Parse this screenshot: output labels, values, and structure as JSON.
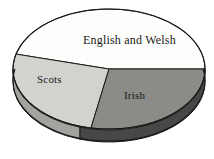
{
  "chart_data": {
    "type": "pie",
    "title": "",
    "subtitle": "",
    "xlabel": "",
    "ylabel": "",
    "legend": "none",
    "grid": false,
    "three_d": true,
    "categories": [
      "English and Welsh",
      "Scots",
      "Irish"
    ],
    "values": [
      46,
      26,
      28
    ],
    "unit": "percent",
    "labels_inside": true,
    "slices": [
      {
        "name": "English and Welsh",
        "value": 46,
        "label": "English and Welsh",
        "top_color": "#fdfdfc",
        "side_color": "#b9b9b6",
        "start_angle_deg": 0,
        "end_angle_deg": 165
      },
      {
        "name": "Scots",
        "value": 26,
        "label": "Scots",
        "top_color": "#d2d2cf",
        "side_color": "#a3a3a0",
        "start_angle_deg": 165,
        "end_angle_deg": 259
      },
      {
        "name": "Irish",
        "value": 28,
        "label": "Irish",
        "top_color": "#8b8b88",
        "side_color": "#474745",
        "start_angle_deg": 259,
        "end_angle_deg": 360
      }
    ]
  },
  "chart": {
    "outline_color": "#1a1a1a",
    "background": "#ffffff",
    "center_x": 109,
    "center_y": 69,
    "radius_x": 96,
    "radius_y": 60,
    "depth": 12
  },
  "labels": {
    "english": "English and Welsh",
    "scots": "Scots",
    "irish": "Irish"
  }
}
